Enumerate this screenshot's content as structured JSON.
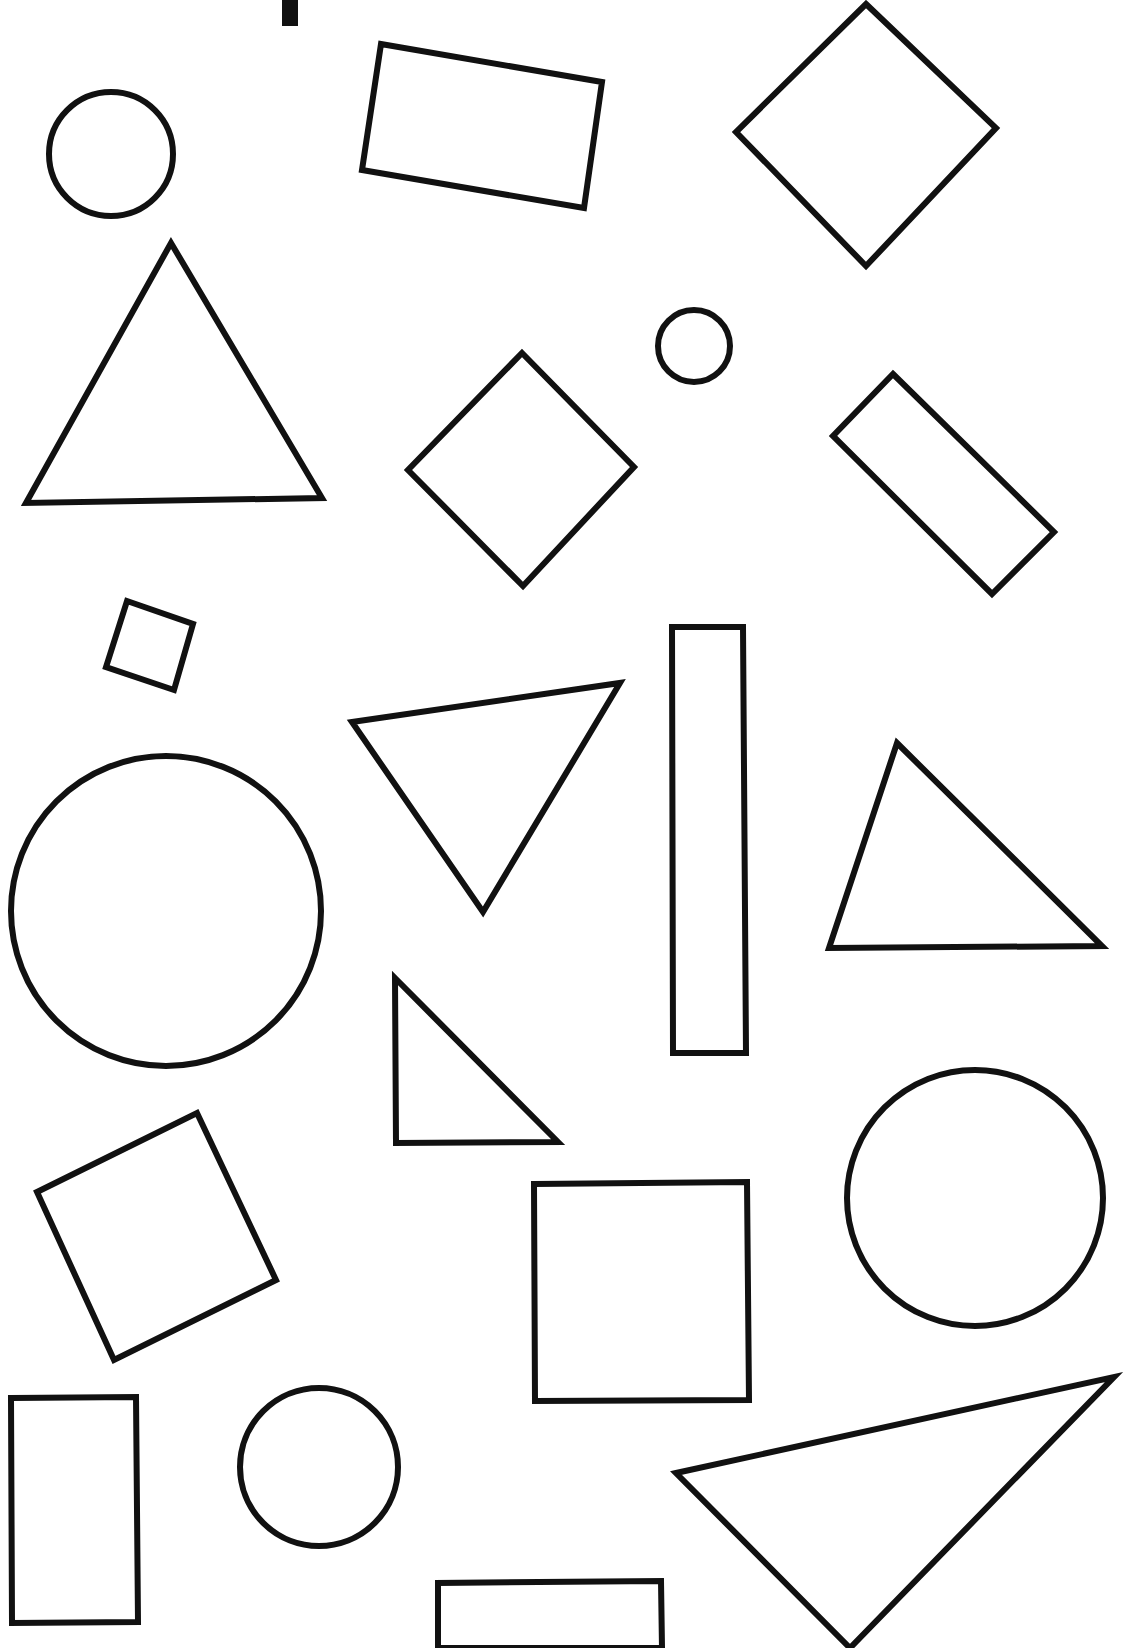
{
  "page": {
    "background": "#ffffff",
    "stroke_color": "#111111",
    "stroke_width": 6
  },
  "shapes": [
    {
      "id": "top-bar",
      "kind": "bar",
      "points": "282,0 298,0 298,26 282,26",
      "filled": true
    },
    {
      "id": "circle-1",
      "kind": "circle",
      "cx": 111,
      "cy": 154,
      "r": 62
    },
    {
      "id": "rect-tilted-1",
      "kind": "rectangle",
      "points": "381,44 602,82 584,208 362,170"
    },
    {
      "id": "diamond-1",
      "kind": "diamond",
      "points": "866,4 996,128 866,266 736,132"
    },
    {
      "id": "triangle-1",
      "kind": "triangle",
      "points": "171,243 322,498 26,503"
    },
    {
      "id": "circle-small",
      "kind": "circle",
      "cx": 694,
      "cy": 346,
      "r": 36
    },
    {
      "id": "diamond-2",
      "kind": "diamond",
      "points": "522,353 634,467 523,586 408,470"
    },
    {
      "id": "rect-diag",
      "kind": "rectangle",
      "points": "893,374 1054,532 992,594 833,436"
    },
    {
      "id": "square-small",
      "kind": "square",
      "points": "127,601 193,624 174,690 106,667"
    },
    {
      "id": "triangle-2",
      "kind": "triangle",
      "points": "352,722 620,683 483,912"
    },
    {
      "id": "rect-tall",
      "kind": "rectangle",
      "points": "672,627 743,627 746,1053 673,1053"
    },
    {
      "id": "triangle-3",
      "kind": "triangle",
      "points": "897,743 1102,946 829,948"
    },
    {
      "id": "circle-large",
      "kind": "circle",
      "cx": 166,
      "cy": 911,
      "r": 155
    },
    {
      "id": "triangle-4",
      "kind": "triangle",
      "points": "395,978 558,1142 396,1143"
    },
    {
      "id": "square-tilted",
      "kind": "square",
      "points": "37,1192 197,1113 276,1280 114,1360"
    },
    {
      "id": "square-1",
      "kind": "square",
      "points": "534,1184 747,1182 749,1400 535,1401"
    },
    {
      "id": "circle-2",
      "kind": "circle",
      "cx": 975,
      "cy": 1198,
      "r": 128
    },
    {
      "id": "rect-small",
      "kind": "rectangle",
      "points": "11,1398 136,1397 138,1622 12,1623"
    },
    {
      "id": "circle-3",
      "kind": "circle",
      "cx": 319,
      "cy": 1467,
      "r": 79
    },
    {
      "id": "triangle-5",
      "kind": "triangle",
      "points": "676,1473 1114,1377 850,1648"
    },
    {
      "id": "rect-bottom",
      "kind": "rectangle",
      "points": "438,1648 438,1583 661,1581 662,1648"
    }
  ]
}
